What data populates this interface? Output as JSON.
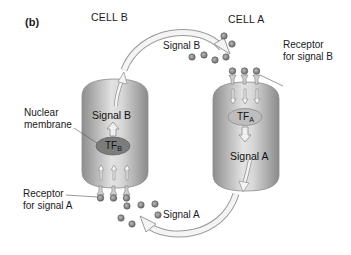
{
  "figure": {
    "panel_label": "(b)",
    "cells": [
      {
        "id": "cell_b",
        "title": "CELL B",
        "transcription_factor": {
          "base": "TF",
          "sub": "B"
        },
        "internal_signal_label": "Signal B",
        "receptor_label_line1": "Receptor",
        "receptor_label_line2": "for signal A"
      },
      {
        "id": "cell_a",
        "title": "CELL A",
        "transcription_factor": {
          "base": "TF",
          "sub": "A"
        },
        "internal_signal_label": "Signal A",
        "receptor_label_line1": "Receptor",
        "receptor_label_line2": "for signal B"
      }
    ],
    "nuclear_membrane_line1": "Nuclear",
    "nuclear_membrane_line2": "membrane",
    "flows": {
      "top_arrow_label": "Signal B",
      "bottom_arrow_label": "Signal A"
    },
    "colors": {
      "cell_fill": "#a9a9a9",
      "cell_highlight": "#e4e4e4",
      "tf_b_fill": "#7c7c7c",
      "tf_a_fill": "#bdbdbd",
      "molecule": "#8a8a8a",
      "arrow_fill": "#f4f4f4",
      "arrow_stroke": "#9a9a9a"
    }
  }
}
